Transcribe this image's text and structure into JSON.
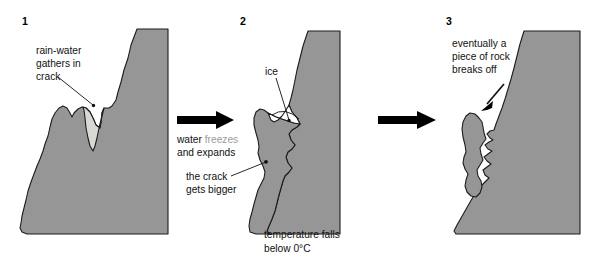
{
  "diagram": {
    "background_color": "#ffffff",
    "rock_color": "#969696",
    "rock_outline_color": "#1c1c1c",
    "water_color": "#d8d8d4",
    "ice_color": "#ffffff",
    "faded_text_color": "#9a9a9a",
    "text_color": "#111111",
    "arrow_color": "#000000"
  },
  "panels": [
    {
      "number": "1",
      "label_lines": [
        "rain-water",
        "gathers in",
        "crack"
      ],
      "fill_name": "water",
      "caption_lines": []
    },
    {
      "number": "2",
      "label_lines": [
        "ice"
      ],
      "secondary_label_lines": [
        "the crack",
        "gets bigger"
      ],
      "fill_name": "ice",
      "caption_lines": [
        "temperature falls",
        "below 0°C"
      ]
    },
    {
      "number": "3",
      "label_lines": [
        "eventually a",
        "piece of rock",
        "breaks off"
      ],
      "fill_name": "none",
      "caption_lines": []
    }
  ],
  "transitions": [
    {
      "id": "t1",
      "lines": [
        {
          "text": "water ",
          "faded": false
        },
        {
          "text": "freezes",
          "faded": true
        }
      ],
      "line1_normal": "water ",
      "line1_faded": "freezes",
      "line2": "and expands"
    },
    {
      "id": "t2",
      "lines": [],
      "line1_normal": "",
      "line1_faded": "",
      "line2": ""
    }
  ],
  "arrows": [
    {
      "name": "arrow-1-to-2"
    },
    {
      "name": "arrow-2-to-3"
    }
  ]
}
